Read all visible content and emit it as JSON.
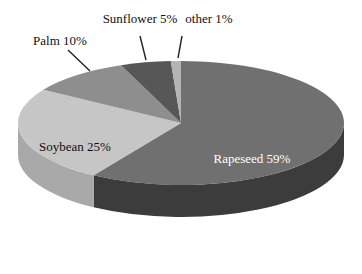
{
  "chart_data": {
    "type": "pie",
    "style": "3d",
    "title": "",
    "categories": [
      "Rapeseed",
      "Soybean",
      "Palm",
      "Sunflower",
      "other"
    ],
    "values": [
      59,
      25,
      10,
      5,
      1
    ],
    "unit": "%",
    "labels": [
      "Rapeseed 59%",
      "Soybean 25%",
      "Palm 10%",
      "Sunflower 5%",
      "other 1%"
    ],
    "colors": {
      "Rapeseed": "#707070",
      "Soybean": "#c6c6c6",
      "Palm": "#8e8e8e",
      "Sunflower": "#575757",
      "other": "#b4b4b4"
    },
    "side_colors": {
      "Rapeseed": "#3c3c3c",
      "Soybean": "#a9a9a9",
      "Palm": "#707070",
      "Sunflower": "#3a3a3a",
      "other": "#909090"
    },
    "legend": "none",
    "label_positions": {
      "Rapeseed": "inside",
      "Soybean": "inside",
      "Palm": "outside-leader",
      "Sunflower": "outside-leader",
      "other": "outside-leader"
    }
  }
}
